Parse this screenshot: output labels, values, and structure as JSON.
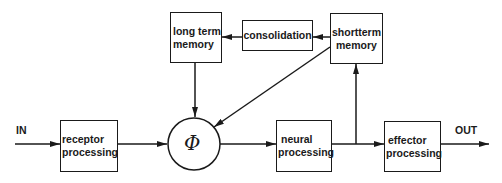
{
  "diagram": {
    "nodes": {
      "long_term_memory": {
        "line1": "long term",
        "line2": "memory"
      },
      "consolidation": {
        "label": "consolidation"
      },
      "shortterm_memory": {
        "line1": "shortterm",
        "line2": "memory"
      },
      "receptor_processing": {
        "line1": "receptor",
        "line2": "processing"
      },
      "phi": {
        "label": "Φ"
      },
      "neural_processing": {
        "line1": "neural",
        "line2": "processing"
      },
      "effector_processing": {
        "line1": "effector",
        "line2": "processing"
      }
    },
    "io": {
      "input": "IN",
      "output": "OUT"
    },
    "edges": [
      {
        "from": "IN",
        "to": "receptor_processing"
      },
      {
        "from": "receptor_processing",
        "to": "phi"
      },
      {
        "from": "phi",
        "to": "neural_processing"
      },
      {
        "from": "neural_processing",
        "to": "effector_processing"
      },
      {
        "from": "neural_processing",
        "to": "shortterm_memory"
      },
      {
        "from": "shortterm_memory",
        "to": "consolidation"
      },
      {
        "from": "consolidation",
        "to": "long_term_memory"
      },
      {
        "from": "long_term_memory",
        "to": "phi"
      },
      {
        "from": "shortterm_memory",
        "to": "phi"
      },
      {
        "from": "effector_processing",
        "to": "OUT"
      }
    ],
    "colors": {
      "stroke": "#1a1a1a",
      "background": "#ffffff"
    }
  }
}
